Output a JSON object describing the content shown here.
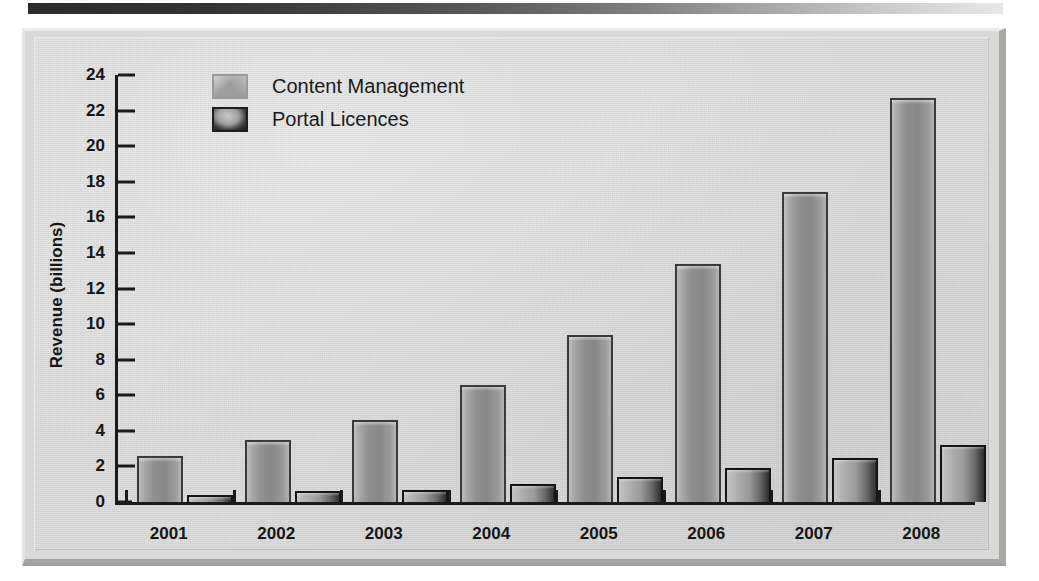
{
  "chart_data": {
    "type": "bar",
    "title": "",
    "xlabel": "",
    "ylabel": "Revenue (billions)",
    "categories": [
      "2001",
      "2002",
      "2003",
      "2004",
      "2005",
      "2006",
      "2007",
      "2008"
    ],
    "series": [
      {
        "name": "Content Management",
        "values": [
          2.6,
          3.5,
          4.6,
          6.6,
          9.4,
          13.4,
          17.4,
          22.7
        ],
        "color": "#9d9d9d"
      },
      {
        "name": "Portal Licences",
        "values": [
          0.4,
          0.6,
          0.7,
          1.0,
          1.4,
          1.9,
          2.5,
          3.2
        ],
        "color": "#2e2e2e"
      }
    ],
    "ylim": [
      0,
      24
    ],
    "yticks": [
      0,
      2,
      4,
      6,
      8,
      10,
      12,
      14,
      16,
      18,
      20,
      22,
      24
    ],
    "ytick_labels": [
      "0",
      "2",
      "4",
      "6",
      "8",
      "10",
      "12",
      "14",
      "16",
      "18",
      "20",
      "22",
      "24"
    ],
    "grid": false,
    "legend_position": "top-left"
  },
  "legend": {
    "items": [
      {
        "label": "Content Management",
        "swatch": "legend-swatch-content-management"
      },
      {
        "label": "Portal Licences",
        "swatch": "legend-swatch-portal-licences"
      }
    ]
  },
  "panel": {
    "background_color": "#dedede",
    "frame_color": "#a9a9a7"
  }
}
